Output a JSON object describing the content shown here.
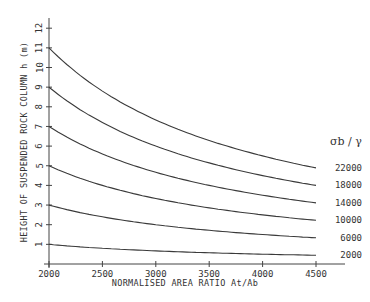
{
  "chart_data": {
    "type": "line",
    "title": "",
    "xlabel": "NORMALISED AREA RATIO  At/Ab",
    "ylabel": "HEIGHT OF SUSPENDED ROCK COLUMN  h  (m)",
    "xlim": [
      2000,
      4500
    ],
    "ylim": [
      0,
      12
    ],
    "x_ticks": [
      2000,
      2500,
      3000,
      3500,
      4000,
      4500
    ],
    "y_ticks": [
      1,
      2,
      3,
      4,
      5,
      6,
      7,
      8,
      9,
      10,
      11,
      12
    ],
    "grid": false,
    "legend_title": "σb / γ",
    "legend_position": "right, at curve ends",
    "x": [
      2000,
      2500,
      3000,
      3500,
      4000,
      4500
    ],
    "series": [
      {
        "name": "22000",
        "values": [
          11.0,
          8.8,
          7.33,
          6.29,
          5.5,
          4.89
        ]
      },
      {
        "name": "18000",
        "values": [
          9.0,
          7.2,
          6.0,
          5.14,
          4.5,
          4.0
        ]
      },
      {
        "name": "14000",
        "values": [
          7.0,
          5.6,
          4.67,
          4.0,
          3.5,
          3.11
        ]
      },
      {
        "name": "10000",
        "values": [
          5.0,
          4.0,
          3.33,
          2.86,
          2.5,
          2.22
        ]
      },
      {
        "name": "6000",
        "values": [
          3.0,
          2.4,
          2.0,
          1.71,
          1.5,
          1.33
        ]
      },
      {
        "name": "2000",
        "values": [
          1.0,
          0.8,
          0.67,
          0.57,
          0.5,
          0.44
        ]
      }
    ]
  }
}
